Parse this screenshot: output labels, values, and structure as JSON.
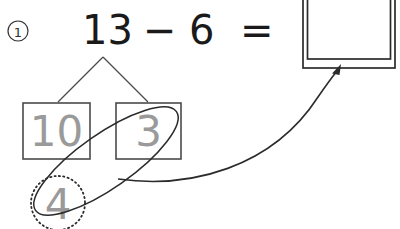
{
  "problem": {
    "marker_label": "1",
    "marker_icon": "circled-number-icon"
  },
  "equation": {
    "minuend": "13",
    "operator": "−",
    "subtrahend": "6",
    "equals": "=",
    "full_text": "13 − 6 ="
  },
  "answer_box": {
    "value": "",
    "placeholder": ""
  },
  "number_bond": {
    "whole": "13",
    "parts": [
      {
        "label": "10"
      },
      {
        "label": "3"
      }
    ]
  },
  "remainder": {
    "label": "4"
  },
  "annotations": {
    "lasso_name": "lasso-loop",
    "arrow_name": "answer-arrow"
  },
  "colors": {
    "ink": "#1a1a1a",
    "pencil_gray": "#9a9a9a",
    "box_stroke": "#4a4a4a",
    "annotation": "#2b2b2b",
    "background": "#ffffff"
  }
}
